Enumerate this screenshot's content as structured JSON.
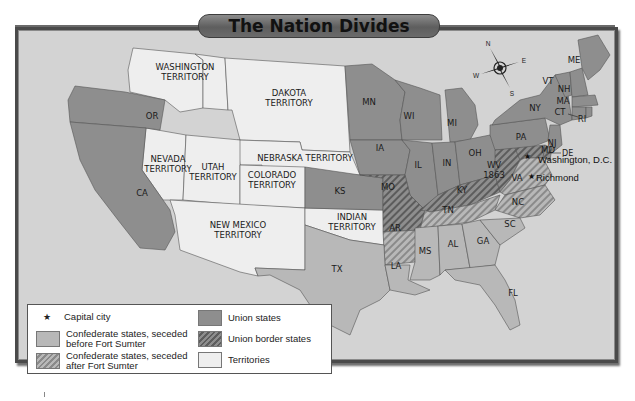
{
  "title": "The Nation Divides",
  "compass": {
    "n": "N",
    "s": "S",
    "e": "E",
    "w": "W"
  },
  "colors": {
    "background": "#d3d3d3",
    "union": "#8e8e8e",
    "union_border": "#8e8e8e",
    "confederate_before": "#b8b8b8",
    "confederate_after": "#b8b8b8",
    "territory": "#eeeeee",
    "frame": "#4a4a4a"
  },
  "territories": {
    "washington": [
      "WASHINGTON",
      "TERRITORY"
    ],
    "dakota": [
      "DAKOTA",
      "TERRITORY"
    ],
    "nebraska": "NEBRASKA TERRITORY",
    "nevada": [
      "NEVADA",
      "TERRITORY"
    ],
    "utah": [
      "UTAH",
      "TERRITORY"
    ],
    "colorado": [
      "COLORADO",
      "TERRITORY"
    ],
    "new_mexico": [
      "NEW MEXICO",
      "TERRITORY"
    ],
    "indian": [
      "INDIAN",
      "TERRITORY"
    ]
  },
  "union_states": [
    "OR",
    "CA",
    "MN",
    "WI",
    "MI",
    "IA",
    "IL",
    "IN",
    "OH",
    "PA",
    "NY",
    "NJ",
    "VT",
    "NH",
    "ME",
    "MA",
    "CT",
    "RI",
    "KS"
  ],
  "union_border_states": [
    "MO",
    "KY",
    "MD",
    "DE",
    "WV"
  ],
  "wv_year": "1863",
  "confederate_before": [
    "TX",
    "LA",
    "MS",
    "AL",
    "GA",
    "FL",
    "SC"
  ],
  "confederate_after": [
    "AR",
    "TN",
    "NC",
    "VA"
  ],
  "labels": {
    "OR": "OR",
    "CA": "CA",
    "MN": "MN",
    "WI": "WI",
    "MI": "MI",
    "IA": "IA",
    "IL": "IL",
    "IN": "IN",
    "OH": "OH",
    "PA": "PA",
    "NY": "NY",
    "NJ": "NJ",
    "VT": "VT",
    "NH": "NH",
    "ME": "ME",
    "MA": "MA",
    "CT": "CT",
    "RI": "RI",
    "KS": "KS",
    "MO": "MO",
    "KY": "KY",
    "MD": "MD",
    "DE": "DE",
    "WV": "WV",
    "TX": "TX",
    "LA": "LA",
    "MS": "MS",
    "AL": "AL",
    "GA": "GA",
    "FL": "FL",
    "SC": "SC",
    "AR": "AR",
    "TN": "TN",
    "NC": "NC",
    "VA": "VA"
  },
  "cities": {
    "washington": "Washington, D.C.",
    "richmond": "Richmond"
  },
  "legend": {
    "capital": "Capital city",
    "capital_symbol": "★",
    "confederate_before": [
      "Confederate states, seceded",
      "before Fort Sumter"
    ],
    "confederate_after": [
      "Confederate states, seceded",
      "after Fort Sumter"
    ],
    "union": "Union states",
    "union_border": "Union border states",
    "territories": "Territories"
  }
}
